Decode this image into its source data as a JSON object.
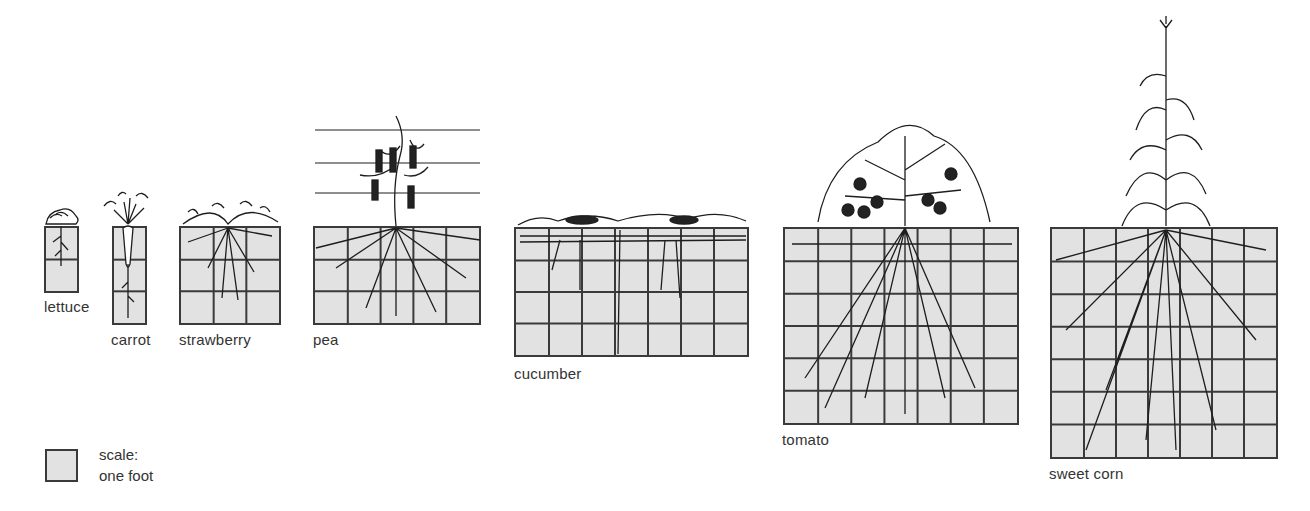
{
  "grid_color": "#e2e2e2",
  "line_color": "#3a3a3a",
  "cell_size_px": 33,
  "legend": {
    "line1": "scale:",
    "line2": "one foot"
  },
  "plants": [
    {
      "id": "lettuce",
      "label": "lettuce",
      "cols": 1,
      "rows": 2,
      "x": 44,
      "y": 226,
      "w": 35,
      "h": 67,
      "label_x": 44,
      "label_y": 302
    },
    {
      "id": "carrot",
      "label": "carrot",
      "cols": 1,
      "rows": 3,
      "x": 112,
      "y": 226,
      "w": 35,
      "h": 99,
      "label_x": 111,
      "label_y": 335
    },
    {
      "id": "strawberry",
      "label": "strawberry",
      "cols": 3,
      "rows": 3,
      "x": 179,
      "y": 226,
      "w": 102,
      "h": 99,
      "label_x": 179,
      "label_y": 335
    },
    {
      "id": "pea",
      "label": "pea",
      "cols": 5,
      "rows": 3,
      "x": 313,
      "y": 226,
      "w": 168,
      "h": 99,
      "label_x": 313,
      "label_y": 335
    },
    {
      "id": "cucumber",
      "label": "cucumber",
      "cols": 7,
      "rows": 4,
      "x": 514,
      "y": 227,
      "w": 235,
      "h": 130,
      "label_x": 514,
      "label_y": 369
    },
    {
      "id": "tomato",
      "label": "tomato",
      "cols": 7,
      "rows": 6,
      "x": 783,
      "y": 227,
      "w": 236,
      "h": 198,
      "label_x": 782,
      "label_y": 435
    },
    {
      "id": "sweet-corn",
      "label": "sweet corn",
      "cols": 7,
      "rows": 7,
      "x": 1050,
      "y": 227,
      "w": 228,
      "h": 232,
      "label_x": 1049,
      "label_y": 469
    }
  ],
  "pea_trellis_y": [
    130,
    163,
    193
  ],
  "chart_data": {
    "type": "table",
    "columns": [
      "plant",
      "spread_ft",
      "depth_ft"
    ],
    "rows": [
      [
        "lettuce",
        1,
        2
      ],
      [
        "carrot",
        1,
        3
      ],
      [
        "strawberry",
        3,
        3
      ],
      [
        "pea",
        5,
        3
      ],
      [
        "cucumber",
        7,
        4
      ],
      [
        "tomato",
        7,
        6
      ],
      [
        "sweet corn",
        7,
        7
      ]
    ],
    "scale": "one foot per square"
  }
}
